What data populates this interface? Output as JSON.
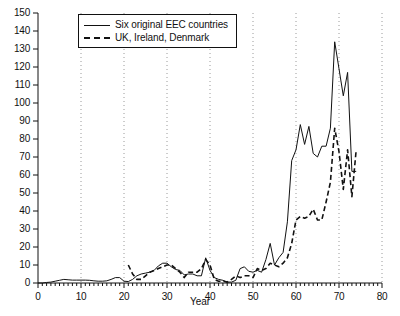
{
  "chart_data": {
    "type": "line",
    "title": "",
    "xlabel": "Year",
    "ylabel": "",
    "xlim": [
      0,
      80
    ],
    "ylim": [
      0,
      150
    ],
    "xticks": [
      0,
      10,
      20,
      30,
      40,
      50,
      60,
      70,
      80
    ],
    "yticks": [
      0,
      10,
      20,
      30,
      40,
      50,
      60,
      70,
      80,
      90,
      100,
      110,
      120,
      130,
      140,
      150
    ],
    "grid": "vertical-dotted",
    "legend_position": "top-center",
    "legend": [
      "Six original EEC countries",
      "UK, Ireland, Denmark"
    ],
    "series": [
      {
        "name": "Six original EEC countries",
        "style": "solid",
        "color": "#111111",
        "x": [
          0,
          1,
          2,
          3,
          4,
          5,
          6,
          7,
          8,
          9,
          10,
          11,
          12,
          13,
          14,
          15,
          16,
          17,
          18,
          19,
          20,
          21,
          22,
          23,
          24,
          25,
          26,
          27,
          28,
          29,
          30,
          31,
          32,
          33,
          34,
          35,
          36,
          37,
          38,
          39,
          40,
          41,
          42,
          43,
          44,
          45,
          46,
          47,
          48,
          49,
          50,
          51,
          52,
          53,
          54,
          55,
          56,
          57,
          58,
          59,
          60,
          61,
          62,
          63,
          64,
          65,
          66,
          67,
          68,
          69,
          70,
          71,
          72,
          73,
          74
        ],
        "values": [
          0,
          0,
          0.3,
          0.5,
          1,
          1.5,
          2,
          1.8,
          1.6,
          1.6,
          1.6,
          1.6,
          1.5,
          1.2,
          1,
          1,
          1.2,
          2,
          3,
          3,
          1,
          0.8,
          2,
          4,
          5,
          5.5,
          6,
          7,
          9.5,
          11,
          11,
          9,
          7.5,
          7,
          4.5,
          5,
          5,
          4,
          4,
          14,
          7,
          3,
          2,
          1.5,
          0.5,
          0.5,
          1.5,
          8,
          9,
          6.5,
          6,
          7,
          6,
          13,
          22,
          10,
          14,
          17,
          34,
          68,
          74,
          88,
          77,
          87,
          72,
          70,
          76,
          76,
          86,
          134,
          119,
          104,
          117,
          62,
          62
        ]
      },
      {
        "name": "UK, Ireland, Denmark",
        "style": "dashed",
        "color": "#111111",
        "x": [
          21,
          22,
          23,
          24,
          25,
          26,
          27,
          28,
          29,
          30,
          31,
          32,
          33,
          34,
          35,
          36,
          37,
          38,
          39,
          40,
          41,
          42,
          43,
          44,
          45,
          46,
          47,
          48,
          49,
          50,
          51,
          52,
          53,
          54,
          55,
          56,
          57,
          58,
          59,
          60,
          61,
          62,
          63,
          64,
          65,
          66,
          67,
          68,
          69,
          70,
          71,
          72,
          73,
          74
        ],
        "values": [
          10,
          5,
          2,
          2,
          4,
          6,
          7,
          8,
          9,
          10,
          10,
          8,
          6,
          3,
          6,
          6,
          6,
          8,
          13,
          10,
          2,
          1,
          1,
          0.5,
          2,
          4,
          3,
          4,
          4,
          3,
          8,
          7,
          8,
          11,
          10,
          9,
          11,
          14,
          22,
          35,
          37,
          36,
          37,
          41,
          35,
          35,
          45,
          56,
          86,
          73,
          52,
          74,
          48,
          74
        ]
      }
    ]
  },
  "axis": {
    "x_tick_labels": [
      "0",
      "10",
      "20",
      "30",
      "40",
      "50",
      "60",
      "70",
      "80"
    ],
    "y_tick_labels": [
      "0",
      "10",
      "20",
      "30",
      "40",
      "50",
      "60",
      "70",
      "80",
      "90",
      "100",
      "110",
      "120",
      "130",
      "140",
      "150"
    ],
    "x_title": "Year"
  },
  "legend": {
    "items": [
      {
        "label": "Six original EEC countries",
        "style": "solid"
      },
      {
        "label": "UK, Ireland, Denmark",
        "style": "dashed"
      }
    ]
  }
}
